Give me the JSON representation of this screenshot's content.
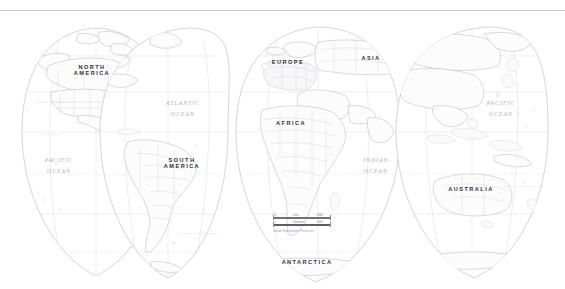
{
  "map": {
    "projection_note": "Goode Homolosine Projection",
    "background_color": "#ffffff",
    "line_color": "#b9bcc2",
    "land_fill": "#fbfbfc",
    "continents": [
      {
        "name": "north-america",
        "label": "NORTH\nAMERICA",
        "line1": "NORTH",
        "line2": "AMERICA",
        "x": 90,
        "y": 68
      },
      {
        "name": "south-america",
        "label": "SOUTH\nAMERICA",
        "line1": "SOUTH",
        "line2": "AMERICA",
        "x": 180,
        "y": 160
      },
      {
        "name": "europe",
        "label": "EUROPE",
        "line1": "EUROPE",
        "line2": "",
        "x": 287,
        "y": 62
      },
      {
        "name": "asia",
        "label": "ASIA",
        "line1": "ASIA",
        "line2": "",
        "x": 370,
        "y": 58
      },
      {
        "name": "africa",
        "label": "AFRICA",
        "line1": "AFRICA",
        "line2": "",
        "x": 290,
        "y": 123
      },
      {
        "name": "australia",
        "label": "AUSTRALIA",
        "line1": "AUSTRALIA",
        "line2": "",
        "x": 470,
        "y": 189
      },
      {
        "name": "antarctica",
        "label": "ANTARCTICA",
        "line1": "ANTARCTICA",
        "line2": "",
        "x": 305,
        "y": 262
      }
    ],
    "oceans": [
      {
        "name": "atlantic-ocean",
        "line1": "ATLANTIC",
        "line2": "OCEAN",
        "x": 182,
        "y": 103
      },
      {
        "name": "pacific-ocean-west",
        "line1": "PACIFIC",
        "line2": "OCEAN",
        "x": 58,
        "y": 160
      },
      {
        "name": "indian-ocean",
        "line1": "INDIAN",
        "line2": "OCEAN",
        "x": 375,
        "y": 160
      },
      {
        "name": "pacific-ocean-east",
        "line1": "PACIFIC",
        "line2": "OCEAN",
        "x": 500,
        "y": 103
      }
    ],
    "grid_lines": [
      {
        "name": "arctic-circle",
        "label": "ARCTIC CIRCLE"
      },
      {
        "name": "tropic-of-cancer",
        "label": "TROPIC OF CANCER"
      },
      {
        "name": "equator",
        "label": "EQUATOR"
      },
      {
        "name": "tropic-of-capricorn",
        "label": "TROPIC OF CAPRICORN"
      },
      {
        "name": "antarctic-circle",
        "label": "ANTARCTIC CIRCLE"
      }
    ],
    "grid_label_texts": {
      "tropic_cancer": "TROPIC OF CANCER",
      "equator": "EQUATOR",
      "tropic_capricorn": "TROPIC OF CAPRICORN",
      "great_dividing": "GREAT DIVIDING RANGE"
    }
  },
  "scale_bar": {
    "name": "scale-bar",
    "miles": {
      "zero": "0",
      "unit": "miles",
      "max": "2000"
    },
    "kilometers": {
      "zero": "0",
      "unit": "kilometers",
      "max": "3000"
    },
    "projection": "Goode Homolosine Projection"
  }
}
